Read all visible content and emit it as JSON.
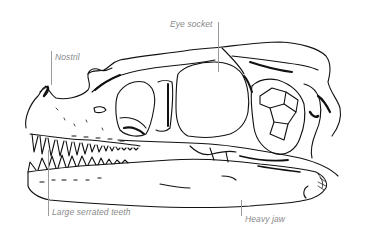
{
  "diagram": {
    "colors": {
      "background": "#ffffff",
      "ink": "#111111",
      "label_text": "#8a8a8a",
      "leader_line": "#9a9a9a"
    },
    "labels": [
      {
        "id": "nostril",
        "text": "Nostril"
      },
      {
        "id": "eye-socket",
        "text": "Eye socket"
      },
      {
        "id": "teeth",
        "text": "Large serrated teeth"
      },
      {
        "id": "jaw",
        "text": "Heavy jaw"
      }
    ]
  }
}
